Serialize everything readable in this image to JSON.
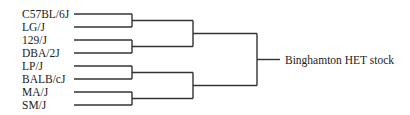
{
  "diagram": {
    "type": "dendrogram",
    "root_label": "Binghamton HET stock",
    "leaves": [
      "C57BL/6J",
      "LG/J",
      "129/J",
      "DBA/2J",
      "LP/J",
      "BALB/cJ",
      "MA/J",
      "SM/J"
    ],
    "tree": [
      [
        [
          "C57BL/6J",
          "LG/J"
        ],
        [
          "129/J",
          "DBA/2J"
        ]
      ],
      [
        [
          "LP/J",
          "BALB/cJ"
        ],
        [
          "MA/J",
          "SM/J"
        ]
      ]
    ]
  }
}
